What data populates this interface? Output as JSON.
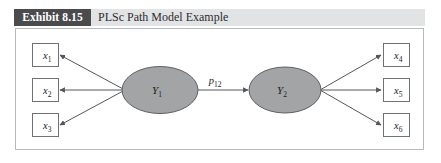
{
  "exhibit": {
    "tag": "Exhibit 8.15",
    "title": "PLSc Path Model Example"
  },
  "colors": {
    "tag_background": "#4b4b4d",
    "tag_text": "#ffffff",
    "header_band": "#e2e3e5",
    "frame_border": "#b9babc",
    "construct_fill": "#a3a4a6",
    "construct_stroke": "#5d5f62",
    "indicator_fill": "#ffffff",
    "indicator_stroke": "#6f7174",
    "path_stroke": "#55575a",
    "page_background": "#ffffff"
  },
  "diagram": {
    "type": "path-model",
    "exogenous_indicators": [
      {
        "base": "x",
        "subscript": "1",
        "label": "x1"
      },
      {
        "base": "x",
        "subscript": "2",
        "label": "x2"
      },
      {
        "base": "x",
        "subscript": "3",
        "label": "x3"
      }
    ],
    "endogenous_indicators": [
      {
        "base": "x",
        "subscript": "4",
        "label": "x4"
      },
      {
        "base": "x",
        "subscript": "5",
        "label": "x5"
      },
      {
        "base": "x",
        "subscript": "6",
        "label": "x6"
      }
    ],
    "constructs": [
      {
        "base": "Y",
        "subscript": "1",
        "label": "Y1"
      },
      {
        "base": "Y",
        "subscript": "2",
        "label": "Y2"
      }
    ],
    "structural_path": {
      "base": "p",
      "subscript": "12",
      "label": "p12",
      "from": "Y1",
      "to": "Y2"
    }
  }
}
